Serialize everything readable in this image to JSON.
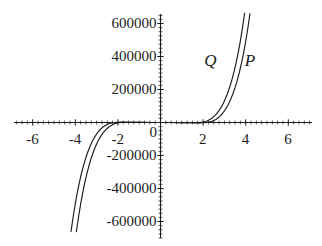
{
  "chart_data": {
    "type": "line",
    "title": "",
    "xlabel": "",
    "ylabel": "",
    "xlim": [
      -7.6,
      7.6
    ],
    "ylim": [
      -760000,
      760000
    ],
    "grid": false,
    "legend_position": "inline-curve-labels",
    "x_ticks": [
      -6,
      -4,
      -2,
      0,
      2,
      4,
      6
    ],
    "x_tick_labels": [
      "-6",
      "-4",
      "-2",
      "0",
      "2",
      "4",
      "6"
    ],
    "y_ticks": [
      -600000,
      -400000,
      -200000,
      200000,
      400000,
      600000
    ],
    "y_tick_labels": [
      "-600000",
      "-400000",
      "-200000",
      "200000",
      "400000",
      "600000"
    ],
    "minor_ticks": true,
    "axis_color": "#1c1c1c",
    "curve_color": "#1c1c1c",
    "series": [
      {
        "name": "P",
        "label": "P",
        "label_x": 3.95,
        "label_y": 430000,
        "points": [
          [
            -4.3,
            -760000
          ],
          [
            -4.2,
            -660000
          ],
          [
            -4.1,
            -571000
          ],
          [
            -4.0,
            -492000
          ],
          [
            -3.9,
            -421000
          ],
          [
            -3.8,
            -358000
          ],
          [
            -3.7,
            -303000
          ],
          [
            -3.6,
            -254000
          ],
          [
            -3.5,
            -211000
          ],
          [
            -3.4,
            -174000
          ],
          [
            -3.3,
            -142000
          ],
          [
            -3.2,
            -114000
          ],
          [
            -3.1,
            -90000
          ],
          [
            -3.0,
            -70000
          ],
          [
            -2.9,
            -53000
          ],
          [
            -2.8,
            -39000
          ],
          [
            -2.7,
            -27500
          ],
          [
            -2.6,
            -18500
          ],
          [
            -2.5,
            -11500
          ],
          [
            -2.4,
            -6300
          ],
          [
            -2.2,
            -800
          ],
          [
            -2.0,
            1500
          ],
          [
            -1.75,
            2000
          ],
          [
            -1.5,
            1400
          ],
          [
            -1.0,
            400
          ],
          [
            -0.5,
            40
          ],
          [
            0.0,
            0
          ],
          [
            0.5,
            -40
          ],
          [
            1.0,
            -400
          ],
          [
            1.5,
            -1400
          ],
          [
            1.75,
            -2000
          ],
          [
            2.0,
            -1500
          ],
          [
            2.2,
            800
          ],
          [
            2.4,
            6300
          ],
          [
            2.5,
            11500
          ],
          [
            2.6,
            18500
          ],
          [
            2.7,
            27500
          ],
          [
            2.8,
            39000
          ],
          [
            2.9,
            53000
          ],
          [
            3.0,
            70000
          ],
          [
            3.1,
            90000
          ],
          [
            3.2,
            114000
          ],
          [
            3.3,
            142000
          ],
          [
            3.4,
            174000
          ],
          [
            3.5,
            211000
          ],
          [
            3.6,
            254000
          ],
          [
            3.7,
            303000
          ],
          [
            3.8,
            358000
          ],
          [
            3.9,
            421000
          ],
          [
            4.0,
            492000
          ],
          [
            4.1,
            571000
          ],
          [
            4.2,
            660000
          ],
          [
            4.3,
            760000
          ]
        ]
      },
      {
        "name": "Q",
        "label": "Q",
        "label_x": 2.05,
        "label_y": 430000,
        "points": [
          [
            -4.05,
            -760000
          ],
          [
            -3.95,
            -662000
          ],
          [
            -3.85,
            -574000
          ],
          [
            -3.75,
            -495000
          ],
          [
            -3.65,
            -425000
          ],
          [
            -3.55,
            -362000
          ],
          [
            -3.45,
            -307000
          ],
          [
            -3.35,
            -258000
          ],
          [
            -3.25,
            -215000
          ],
          [
            -3.15,
            -177000
          ],
          [
            -3.05,
            -145000
          ],
          [
            -2.95,
            -117000
          ],
          [
            -2.85,
            -93000
          ],
          [
            -2.75,
            -72500
          ],
          [
            -2.65,
            -55500
          ],
          [
            -2.55,
            -41500
          ],
          [
            -2.45,
            -30000
          ],
          [
            -2.35,
            -20500
          ],
          [
            -2.25,
            -13200
          ],
          [
            -2.15,
            -7600
          ],
          [
            -2.0,
            -2200
          ],
          [
            -1.85,
            500
          ],
          [
            -1.65,
            1600
          ],
          [
            -1.4,
            1300
          ],
          [
            -1.0,
            450
          ],
          [
            -0.5,
            50
          ],
          [
            0.0,
            0
          ],
          [
            0.5,
            -50
          ],
          [
            1.0,
            -450
          ],
          [
            1.4,
            -1300
          ],
          [
            1.65,
            -1600
          ],
          [
            1.85,
            -500
          ],
          [
            2.0,
            2200
          ],
          [
            2.15,
            7600
          ],
          [
            2.25,
            13200
          ],
          [
            2.35,
            20500
          ],
          [
            2.45,
            30000
          ],
          [
            2.55,
            41500
          ],
          [
            2.65,
            55500
          ],
          [
            2.75,
            72500
          ],
          [
            2.85,
            93000
          ],
          [
            2.95,
            117000
          ],
          [
            3.05,
            145000
          ],
          [
            3.15,
            177000
          ],
          [
            3.25,
            215000
          ],
          [
            3.35,
            258000
          ],
          [
            3.45,
            307000
          ],
          [
            3.55,
            362000
          ],
          [
            3.65,
            425000
          ],
          [
            3.75,
            495000
          ],
          [
            3.85,
            574000
          ],
          [
            3.95,
            662000
          ],
          [
            4.05,
            760000
          ]
        ]
      }
    ]
  }
}
